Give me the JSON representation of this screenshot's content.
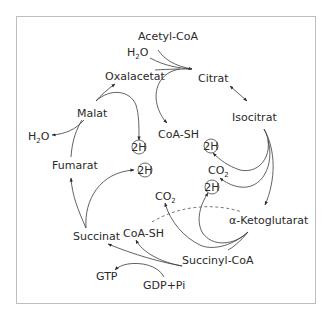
{
  "diagram": {
    "metabolites": {
      "acetyl_coa": "Acetyl-CoA",
      "citrat": "Citrat",
      "isocitrat": "Isocitrat",
      "ketoglutarat": "α-Ketoglutarat",
      "succinyl_coa": "Succinyl-CoA",
      "succinat": "Succinat",
      "fumarat": "Fumarat",
      "malat": "Malat",
      "oxalacetat": "Oxalacetat"
    },
    "cofactors": {
      "h2o_top": {
        "base": "H",
        "sub": "2",
        "rest": "O"
      },
      "h2o_left": {
        "base": "H",
        "sub": "2",
        "rest": "O"
      },
      "coa_sh_top": "CoA-SH",
      "coa_sh_bottom": "CoA-SH",
      "co2_right": {
        "base": "CO",
        "sub": "2"
      },
      "co2_mid": {
        "base": "CO",
        "sub": "2"
      },
      "gtp": "GTP",
      "gdp_pi": "GDP+Pi",
      "twoH": "2H"
    }
  }
}
